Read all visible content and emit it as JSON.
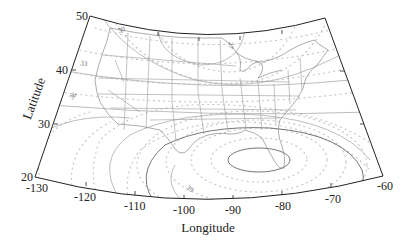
{
  "map": {
    "projection": "conic",
    "region": "Contiguous United States",
    "xlabel": "Longitude",
    "ylabel": "Latitude",
    "lon_ticks": [
      {
        "label": "-130",
        "x": 35,
        "y": 177
      },
      {
        "label": "-120",
        "x": 86,
        "y": 186
      },
      {
        "label": "-110",
        "x": 135,
        "y": 195
      },
      {
        "label": "-100",
        "x": 184,
        "y": 199
      },
      {
        "label": "-90",
        "x": 233,
        "y": 199
      },
      {
        "label": "-80",
        "x": 282,
        "y": 195
      },
      {
        "label": "-70",
        "x": 331,
        "y": 187
      },
      {
        "label": "-60",
        "x": 383,
        "y": 176
      }
    ],
    "lat_ticks": [
      {
        "label": "20",
        "x": 35,
        "y": 177
      },
      {
        "label": "30",
        "x": 54,
        "y": 124
      },
      {
        "label": "40",
        "x": 72,
        "y": 70
      },
      {
        "label": "50",
        "x": 90,
        "y": 16
      }
    ],
    "lon_range": [
      -130,
      -60
    ],
    "lat_range": [
      20,
      50
    ],
    "contour_labels": [
      {
        "text": "30",
        "x": 119,
        "y": 33,
        "rotate": -20
      },
      {
        "text": "33",
        "x": 85,
        "y": 64,
        "rotate": 10
      },
      {
        "text": "36",
        "x": 73,
        "y": 98,
        "rotate": -45
      },
      {
        "text": "27",
        "x": 232,
        "y": 46,
        "rotate": 90
      },
      {
        "text": "39",
        "x": 190,
        "y": 191,
        "rotate": 40
      }
    ],
    "colors": {
      "frame": "#222222",
      "state_lines": "#9a9a9a",
      "contour_solid": "#bdbdbd",
      "contour_dark": "#777777",
      "contour_dotted": "#c4c4c4"
    }
  }
}
